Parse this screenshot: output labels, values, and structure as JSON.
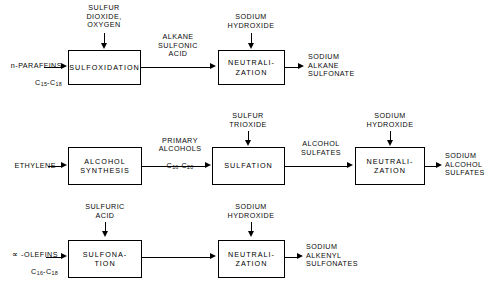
{
  "diagram": {
    "type": "process-flow",
    "line_color": "#000000",
    "background_color": "#ffffff"
  },
  "rows": [
    {
      "id": "alkane-sulfonate-route",
      "feedstock": {
        "name": "n-PARAFFINS",
        "carbon_range": "C15-C18"
      },
      "reagents": [
        {
          "label": "SULFUR\nDIOXIDE,\nOXYGEN"
        },
        {
          "label": "SODIUM\nHYDROXIDE"
        }
      ],
      "units": [
        {
          "label": "SULFOXIDATION"
        },
        {
          "label": "NEUTRALI-\nZATION"
        }
      ],
      "intermediates": [
        {
          "label": "ALKANE\nSULFONIC\nACID"
        }
      ],
      "product": {
        "label": "SODIUM\nALKANE\nSULFONATE"
      }
    },
    {
      "id": "alcohol-sulfate-route",
      "feedstock": {
        "name": "ETHYLENE",
        "carbon_range": ""
      },
      "reagents": [
        {
          "label": "SULFUR\nTRIOXIDE"
        },
        {
          "label": "SODIUM\nHYDROXIDE"
        }
      ],
      "units": [
        {
          "label": "ALCOHOL\nSYNTHESIS"
        },
        {
          "label": "SULFATION"
        },
        {
          "label": "NEUTRALI-\nZATION"
        }
      ],
      "intermediates": [
        {
          "label": "PRIMARY\nALCOHOLS",
          "carbon_range": "C16-C20"
        },
        {
          "label": "ALCOHOL\nSULFATES"
        }
      ],
      "product": {
        "label": "SODIUM\nALCOHOL\nSULFATES"
      }
    },
    {
      "id": "alkenyl-sulfonate-route",
      "feedstock": {
        "name": "OLEFINS",
        "prefix": "∝ -",
        "carbon_range": "C16-C18"
      },
      "reagents": [
        {
          "label": "SULFURIC\nACID"
        },
        {
          "label": "SODIUM\nHYDROXIDE"
        }
      ],
      "units": [
        {
          "label": "SULFONA-\nTION"
        },
        {
          "label": "NEUTRALI-\nZATION"
        }
      ],
      "intermediates": [],
      "product": {
        "label": "SODIUM\nALKENYL\nSULFONATES"
      }
    }
  ],
  "labels": {
    "r1_feed_name": "n-PARAFFINS",
    "r1_feed_sub_a": "C",
    "r1_feed_sub_a_n": "15",
    "r1_feed_sub_b": "-C",
    "r1_feed_sub_b_n": "18",
    "r1_reagent1": "SULFUR\nDIOXIDE,\nOXYGEN",
    "r1_unit1": "SULFOXIDATION",
    "r1_mid1": "ALKANE\nSULFONIC\nACID",
    "r1_reagent2": "SODIUM\nHYDROXIDE",
    "r1_unit2": "NEUTRALI-\nZATION",
    "r1_product": "SODIUM\nALKANE\nSULFONATE",
    "r2_feed_name": "ETHYLENE",
    "r2_unit1": "ALCOHOL\nSYNTHESIS",
    "r2_mid1": "PRIMARY\nALCOHOLS",
    "r2_mid1_sub_a": "C",
    "r2_mid1_sub_a_n": "16",
    "r2_mid1_sub_b": "-C",
    "r2_mid1_sub_b_n": "20",
    "r2_reagent1": "SULFUR\nTRIOXIDE",
    "r2_unit2": "SULFATION",
    "r2_mid2": "ALCOHOL\nSULFATES",
    "r2_reagent2": "SODIUM\nHYDROXIDE",
    "r2_unit3": "NEUTRALI-\nZATION",
    "r2_product": "SODIUM\nALCOHOL\nSULFATES",
    "r3_feed_prefix": "∝ -",
    "r3_feed_name": "OLEFINS",
    "r3_feed_sub_a": "C",
    "r3_feed_sub_a_n": "16",
    "r3_feed_sub_b": "-C",
    "r3_feed_sub_b_n": "18",
    "r3_reagent1": "SULFURIC\nACID",
    "r3_unit1": "SULFONA-\nTION",
    "r3_reagent2": "SODIUM\nHYDROXIDE",
    "r3_unit2": "NEUTRALI-\nZATION",
    "r3_product": "SODIUM\nALKENYL\nSULFONATES"
  }
}
